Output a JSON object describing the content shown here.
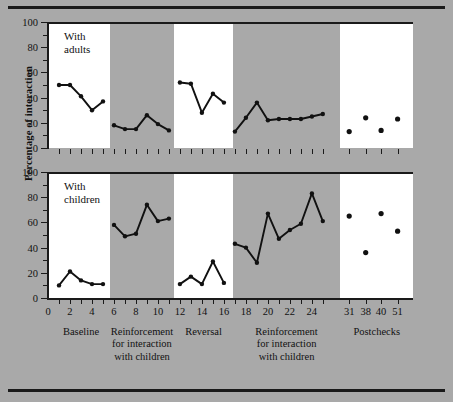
{
  "figure": {
    "ylabel": "Percentage of interaction",
    "background_color": "#a9a9a9",
    "panel_color": "#ffffff",
    "band_color": "#a9a9a9",
    "ink_color": "#111111"
  },
  "yaxis": {
    "min": 0,
    "max": 100,
    "major_ticks": [
      0,
      20,
      40,
      60,
      80,
      100
    ],
    "minor_step": 10,
    "tick_labels": [
      "0",
      "20",
      "40",
      "60",
      "80",
      "100"
    ]
  },
  "xaxis": {
    "tick_labels": [
      "0",
      "2",
      "4",
      "6",
      "8",
      "10",
      "12",
      "14",
      "16",
      "18",
      "20",
      "22",
      "24",
      "31",
      "38",
      "40",
      "51"
    ],
    "tick_values": [
      0,
      2,
      4,
      6,
      8,
      10,
      12,
      14,
      16,
      18,
      20,
      22,
      24,
      31,
      38,
      40,
      51
    ],
    "session_min": 0,
    "session_max": 25
  },
  "phases": [
    {
      "name": "Baseline",
      "lines": [
        "Baseline"
      ],
      "shaded": false,
      "x_start": 0.4,
      "x_end": 5.6
    },
    {
      "name": "Reinforcement for interaction with children",
      "lines": [
        "Reinforcement",
        "for interaction",
        "with children"
      ],
      "shaded": true,
      "x_start": 5.6,
      "x_end": 11.5
    },
    {
      "name": "Reversal",
      "lines": [
        "Reversal"
      ],
      "shaded": false,
      "x_start": 11.5,
      "x_end": 16.8
    },
    {
      "name": "Reinforcement for interaction with children",
      "lines": [
        "Reinforcement",
        "for interaction",
        "with children"
      ],
      "shaded": true,
      "x_start": 16.8,
      "x_end": 26.6
    },
    {
      "name": "Postchecks",
      "lines": [
        "Postchecks"
      ],
      "shaded": false,
      "x_start": 26.6,
      "x_end": 33.2
    }
  ],
  "chart_data": {
    "type": "line",
    "title": "",
    "xlabel": "",
    "ylabel": "Percentage of interaction",
    "ylim": [
      0,
      100
    ],
    "grid": false,
    "legend": "none",
    "panels": [
      {
        "name": "with-adults",
        "label_lines": [
          "With",
          "adults"
        ],
        "series": [
          {
            "name": "Baseline",
            "phase": "Baseline",
            "connected": true,
            "x": [
              1,
              2,
              3,
              4,
              5
            ],
            "values": [
              50,
              50,
              41,
              30,
              37
            ]
          },
          {
            "name": "Reinforcement 1",
            "phase": "Reinforcement for interaction with children",
            "connected": true,
            "x": [
              6,
              7,
              8,
              9,
              10,
              11
            ],
            "values": [
              18,
              15,
              15,
              26,
              19,
              14
            ]
          },
          {
            "name": "Reversal",
            "phase": "Reversal",
            "connected": true,
            "x": [
              12,
              13,
              14,
              15,
              16
            ],
            "values": [
              52,
              51,
              28,
              43,
              36
            ]
          },
          {
            "name": "Reinforcement 2",
            "phase": "Reinforcement for interaction with children",
            "connected": true,
            "x": [
              17,
              18,
              19,
              20,
              21,
              22,
              23,
              24,
              25
            ],
            "values": [
              13,
              24,
              36,
              22,
              23,
              23,
              23,
              25,
              27
            ]
          },
          {
            "name": "Postchecks",
            "phase": "Postchecks",
            "connected": false,
            "x": [
              31,
              38,
              40,
              51
            ],
            "values": [
              13,
              24,
              14,
              23
            ]
          }
        ]
      },
      {
        "name": "with-children",
        "label_lines": [
          "With",
          "children"
        ],
        "series": [
          {
            "name": "Baseline",
            "phase": "Baseline",
            "connected": true,
            "x": [
              1,
              2,
              3,
              4,
              5
            ],
            "values": [
              10,
              21,
              14,
              11,
              11
            ]
          },
          {
            "name": "Reinforcement 1",
            "phase": "Reinforcement for interaction with children",
            "connected": true,
            "x": [
              6,
              7,
              8,
              9,
              10,
              11
            ],
            "values": [
              58,
              49,
              51,
              74,
              61,
              63
            ]
          },
          {
            "name": "Reversal",
            "phase": "Reversal",
            "connected": true,
            "x": [
              12,
              13,
              14,
              15,
              16
            ],
            "values": [
              11,
              17,
              11,
              29,
              12
            ]
          },
          {
            "name": "Reinforcement 2",
            "phase": "Reinforcement for interaction with children",
            "connected": true,
            "x": [
              17,
              18,
              19,
              20,
              21,
              22,
              23,
              24,
              25
            ],
            "values": [
              43,
              40,
              28,
              67,
              47,
              54,
              59,
              83,
              61
            ]
          },
          {
            "name": "Postchecks",
            "phase": "Postchecks",
            "connected": false,
            "x": [
              31,
              38,
              40,
              51
            ],
            "values": [
              65,
              36,
              67,
              53
            ]
          }
        ]
      }
    ]
  }
}
